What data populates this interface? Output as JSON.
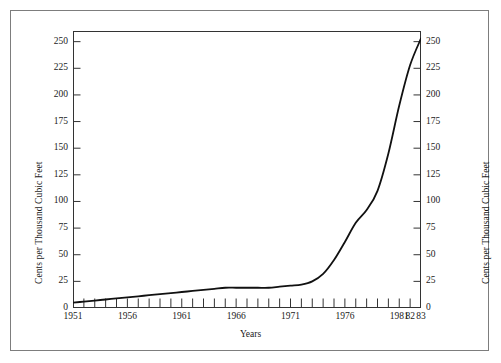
{
  "chart_data": {
    "type": "line",
    "title": "",
    "xlabel": "Years",
    "ylabel": "Cents per Thousand Cubic Feet",
    "ylabel_right": "Cents per Thousand Cubic Feet",
    "xlim": [
      1951,
      1983
    ],
    "ylim": [
      0,
      260
    ],
    "y_ticks": [
      0,
      25,
      50,
      75,
      100,
      125,
      150,
      175,
      200,
      225,
      250
    ],
    "y_tick_labels": [
      "0",
      "25",
      "50",
      "75",
      "100",
      "125",
      "150",
      "175",
      "200",
      "225",
      "250"
    ],
    "x_ticks": [
      1951,
      1952,
      1953,
      1954,
      1955,
      1956,
      1957,
      1958,
      1959,
      1960,
      1961,
      1962,
      1963,
      1964,
      1965,
      1966,
      1967,
      1968,
      1969,
      1970,
      1971,
      1972,
      1973,
      1974,
      1975,
      1976,
      1977,
      1978,
      1979,
      1980,
      1981,
      1982,
      1983
    ],
    "x_tick_labels": [
      {
        "x": 1951,
        "label": "1951"
      },
      {
        "x": 1956,
        "label": "1956"
      },
      {
        "x": 1961,
        "label": "1961"
      },
      {
        "x": 1966,
        "label": "1966"
      },
      {
        "x": 1971,
        "label": "1971"
      },
      {
        "x": 1976,
        "label": "1976"
      },
      {
        "x": 1981,
        "label": "1981"
      },
      {
        "x": 1982,
        "label": "82"
      },
      {
        "x": 1983,
        "label": "83"
      }
    ],
    "grid": false,
    "legend": false,
    "series": [
      {
        "name": "Price of natural gas",
        "color": "#111111",
        "x": [
          1951,
          1952,
          1953,
          1954,
          1955,
          1956,
          1957,
          1958,
          1959,
          1960,
          1961,
          1962,
          1963,
          1964,
          1965,
          1966,
          1967,
          1968,
          1969,
          1970,
          1971,
          1972,
          1973,
          1974,
          1975,
          1976,
          1977,
          1978,
          1979,
          1980,
          1981,
          1982,
          1983
        ],
        "values": [
          5,
          6,
          7,
          8,
          9,
          10,
          11,
          12,
          13,
          14,
          15,
          16,
          17,
          18,
          19,
          19,
          19,
          19,
          19,
          20,
          21,
          22,
          25,
          32,
          45,
          62,
          80,
          92,
          110,
          145,
          190,
          228,
          253
        ]
      }
    ],
    "line_width": 1.8,
    "axis_color": "#333333",
    "frame_color": "#7d7d7d",
    "background": "#ffffff"
  },
  "figure": {
    "outer_frame_name": "figure-border"
  }
}
